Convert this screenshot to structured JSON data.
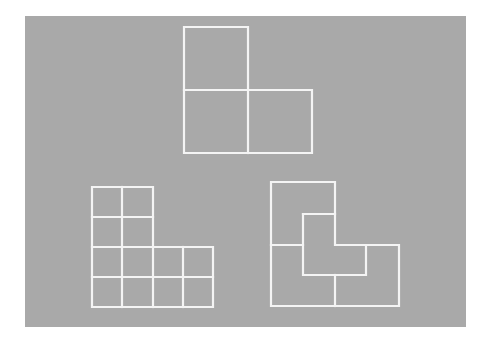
{
  "canvas": {
    "width": 483,
    "height": 343,
    "page_bg": "#ffffff"
  },
  "panel": {
    "x": 25,
    "y": 16,
    "width": 441,
    "height": 311,
    "fill": "#a9a9a9"
  },
  "stroke": {
    "color": "#f4f4f4",
    "width": 2.2
  },
  "figures": [
    {
      "name": "top-l-shape-three-squares",
      "polylines": [
        [
          [
            184,
            27
          ],
          [
            248,
            27
          ],
          [
            248,
            90
          ],
          [
            312,
            90
          ],
          [
            312,
            153
          ],
          [
            184,
            153
          ],
          [
            184,
            27
          ]
        ],
        [
          [
            184,
            90
          ],
          [
            248,
            90
          ]
        ],
        [
          [
            248,
            90
          ],
          [
            248,
            153
          ]
        ]
      ]
    },
    {
      "name": "bottom-left-l-shape-grid-twelve-squares",
      "polylines": [
        [
          [
            92,
            187
          ],
          [
            153,
            187
          ],
          [
            153,
            247
          ],
          [
            213,
            247
          ],
          [
            213,
            307
          ],
          [
            92,
            307
          ],
          [
            92,
            187
          ]
        ],
        [
          [
            122,
            187
          ],
          [
            122,
            307
          ]
        ],
        [
          [
            92,
            217
          ],
          [
            153,
            217
          ]
        ],
        [
          [
            92,
            247
          ],
          [
            153,
            247
          ]
        ],
        [
          [
            92,
            277
          ],
          [
            213,
            277
          ]
        ],
        [
          [
            153,
            247
          ],
          [
            153,
            307
          ]
        ],
        [
          [
            183,
            247
          ],
          [
            183,
            307
          ]
        ]
      ]
    },
    {
      "name": "bottom-right-l-shape-four-l-pieces",
      "polylines": [
        [
          [
            271,
            182
          ],
          [
            335,
            182
          ],
          [
            335,
            245
          ],
          [
            399,
            245
          ],
          [
            399,
            306
          ],
          [
            271,
            306
          ],
          [
            271,
            182
          ]
        ],
        [
          [
            271,
            245
          ],
          [
            303,
            245
          ]
        ],
        [
          [
            303,
            214
          ],
          [
            335,
            214
          ]
        ],
        [
          [
            303,
            214
          ],
          [
            303,
            275
          ],
          [
            366,
            275
          ],
          [
            366,
            245
          ]
        ],
        [
          [
            335,
            275
          ],
          [
            335,
            306
          ]
        ]
      ]
    }
  ]
}
